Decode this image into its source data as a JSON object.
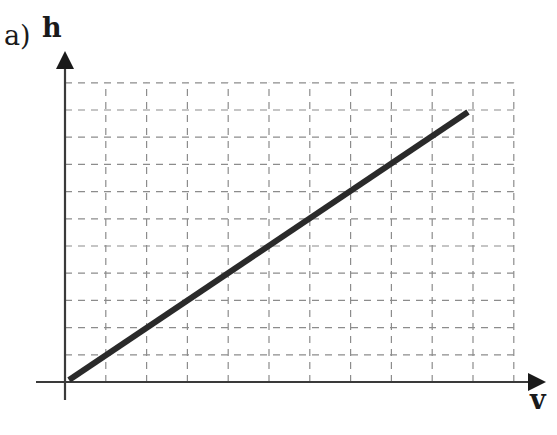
{
  "figure": {
    "part_label": "a)",
    "y_axis_label": "h",
    "x_axis_label": "v"
  },
  "colors": {
    "axis": "#3a3a3a",
    "grid": "#8c8c8c",
    "line": "#2a2a2a",
    "background": "#ffffff"
  },
  "chart_data": {
    "type": "line",
    "title": "",
    "xlabel": "v",
    "ylabel": "h",
    "grid": true,
    "grid_style": "dashed",
    "x_grid_divisions": 11,
    "y_grid_divisions": 11,
    "xlim": [
      0,
      11
    ],
    "ylim": [
      0,
      11
    ],
    "tick_labels": false,
    "legend": null,
    "series": [
      {
        "name": "h vs v",
        "x": [
          0,
          10
        ],
        "y": [
          0,
          10
        ]
      }
    ],
    "annotations": [
      "a)"
    ]
  }
}
